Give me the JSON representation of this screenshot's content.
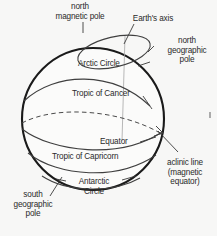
{
  "figure": {
    "background_color": "#f7f7f6",
    "ink_color": "#2a2a2a",
    "globe_outline_color": "#1a1a1a",
    "gridline_color": "#4a4a4a",
    "axis_line_color": "#9a9a9a",
    "leader_line_color": "#3a3a3a"
  },
  "labels": {
    "north_magnetic_pole": "north\nmagnetic pole",
    "earths_axis": "Earth's axis",
    "north_geographic_pole": "north\ngeographic\npole",
    "arctic_circle": "Arctic Circle",
    "tropic_of_cancer": "Tropic of Cancer",
    "equator": "Equator",
    "tropic_of_capricorn": "Tropic of Capricorn",
    "aclinic_line": "aclinic line\n(magnetic\nequator)",
    "antarctic_circle": "Antarctic\nCircle",
    "south_geographic_pole": "south\ngeographic\npole"
  },
  "features": [
    {
      "name": "globe-outline",
      "style": "solid",
      "weight": "thick"
    },
    {
      "name": "arctic-circle",
      "style": "solid",
      "weight": "thin"
    },
    {
      "name": "tropic-of-cancer",
      "style": "solid",
      "weight": "thin"
    },
    {
      "name": "equator",
      "style": "solid",
      "weight": "thin"
    },
    {
      "name": "aclinic-line",
      "style": "dashed",
      "weight": "thin"
    },
    {
      "name": "tropic-of-capricorn",
      "style": "solid",
      "weight": "thin"
    },
    {
      "name": "antarctic-circle",
      "style": "solid",
      "weight": "thin"
    },
    {
      "name": "earths-axis",
      "style": "solid",
      "weight": "hairline"
    }
  ]
}
